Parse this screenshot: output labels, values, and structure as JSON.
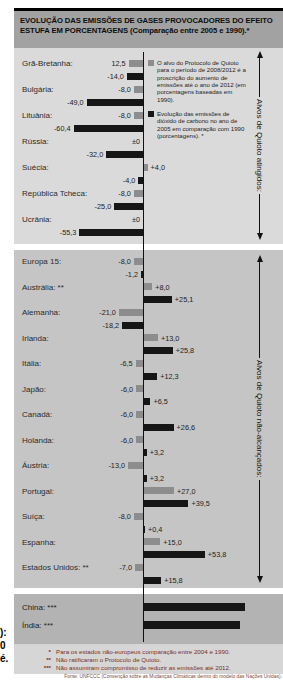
{
  "title": "EVOLUÇÃO DAS EMISSÕES DE GASES PROVOCADORES DO EFEITO ESTUFA EM PORCENTAGENS (Comparação entre 2005 e 1990).*",
  "legend": {
    "kyoto_target": {
      "swatch_color": "#8d8d8d",
      "text": "O alvo do Protocolo de Quioto para o período de 2008/2012 é a proscrição do aumento de emissões até o ano de 2012 (em porcentagens baseadas em 1990)."
    },
    "actual_2005": {
      "swatch_color": "#161616",
      "text": "Evolução das emissões de dióxido de carbono no ano de 2005 em comparação com 1990 (porcentagens). *"
    }
  },
  "side_labels": {
    "achieved": "Alvos de Quioto atingidos:",
    "not_achieved": "Alvos de Quioto não-alcançados:"
  },
  "footnotes": [
    {
      "marker": "*",
      "text": "Para os estados não-europeus comparação entre 2004 e 1990."
    },
    {
      "marker": "**",
      "text": "Não ratificaram o Protocolo de Quioto."
    },
    {
      "marker": "***",
      "text": "Não assumiram compromisso de reduzir as emissões até 2012."
    }
  ],
  "source": "Fonte: UNFCCC (Convenção sobre as Mudanças Climáticas dentro do modelo das Nações Unidas).",
  "edge_fragments": [
    "):",
    "0",
    "é."
  ],
  "colors": {
    "target_bar": "#8d8d8d",
    "actual_bar": "#161616",
    "title_band_bg": "#a2a2a2",
    "section1_bg": "#dadada",
    "section2_bg": "#c5c5c5",
    "section3_bg": "#b3b3b3",
    "footnote_bg": "#d6d6d6",
    "footnote_text": "#7b2f1d"
  },
  "chart_data": {
    "type": "bar",
    "orientation": "horizontal-diverging",
    "unit": "%",
    "baseline": 0,
    "series": [
      {
        "name": "Alvo do Protocolo de Quioto 2008/2012 (base 1990)",
        "color": "#8d8d8d"
      },
      {
        "name": "Emissões de CO2 em 2005 em comparação com 1990",
        "color": "#161616"
      }
    ],
    "groups": [
      {
        "name": "Alvos de Quioto atingidos:",
        "rows": [
          {
            "label": "Grã-Bretanha:",
            "target_label": "12,5",
            "target": -12.5,
            "actual_label": "-14,0",
            "actual": -14.0
          },
          {
            "label": "Bulgária:",
            "target_label": "-8,0",
            "target": -8.0,
            "actual_label": "-49,0",
            "actual": -49.0
          },
          {
            "label": "Lituânia:",
            "target_label": "-8,0",
            "target": -8.0,
            "actual_label": "-60,4",
            "actual": -60.4
          },
          {
            "label": "Rússia:",
            "target_label": "±0",
            "target": 0,
            "actual_label": "-32,0",
            "actual": -32.0
          },
          {
            "label": "Suécia:",
            "target_label": "+4,0",
            "target": 4.0,
            "actual_label": "-4,0",
            "actual": -4.0
          },
          {
            "label": "República Tcheca:",
            "target_label": "-8,0",
            "target": -8.0,
            "actual_label": "-25,0",
            "actual": -25.0
          },
          {
            "label": "Ucrânia:",
            "target_label": "±0",
            "target": 0,
            "actual_label": "-55,3",
            "actual": -55.3
          }
        ]
      },
      {
        "name": "Alvos de Quioto não-alcançados:",
        "rows": [
          {
            "label": "Europa 15:",
            "target_label": "-8,0",
            "target": -8.0,
            "actual_label": "-1,2",
            "actual": -1.2
          },
          {
            "label": "Austrália: **",
            "target_label": "+8,0",
            "target": 8.0,
            "actual_label": "+25,1",
            "actual": 25.1
          },
          {
            "label": "Alemanha:",
            "target_label": "-21,0",
            "target": -21.0,
            "actual_label": "-18,2",
            "actual": -18.2
          },
          {
            "label": "Irlanda:",
            "target_label": "+13,0",
            "target": 13.0,
            "actual_label": "+25,8",
            "actual": 25.8
          },
          {
            "label": "Itália:",
            "target_label": "-6,5",
            "target": -6.5,
            "actual_label": "+12,3",
            "actual": 12.3
          },
          {
            "label": "Japão:",
            "target_label": "-6,0",
            "target": -6.0,
            "actual_label": "+6,5",
            "actual": 6.5
          },
          {
            "label": "Canadá:",
            "target_label": "-6,0",
            "target": -6.0,
            "actual_label": "+26,6",
            "actual": 26.6
          },
          {
            "label": "Holanda:",
            "target_label": "-6,0",
            "target": -6.0,
            "actual_label": "+3,2",
            "actual": 3.2
          },
          {
            "label": "Áustria:",
            "target_label": "-13,0",
            "target": -13.0,
            "actual_label": "+3,2",
            "actual": 3.2
          },
          {
            "label": "Portugal:",
            "target_label": "+27,0",
            "target": 27.0,
            "actual_label": "+39,5",
            "actual": 39.5
          },
          {
            "label": "Suíça:",
            "target_label": "-8,0",
            "target": -8.0,
            "actual_label": "+0,4",
            "actual": 0.4
          },
          {
            "label": "Espanha:",
            "target_label": "+15,0",
            "target": 15.0,
            "actual_label": "+53,8",
            "actual": 53.8
          },
          {
            "label": "Estados Unidos: **",
            "target_label": "-7,0",
            "target": -7.0,
            "actual_label": "+15,8",
            "actual": 15.8
          }
        ]
      },
      {
        "name": "",
        "rows": [
          {
            "label": "China: ***",
            "actual": null,
            "actual_label": "",
            "bar_px": 102
          },
          {
            "label": "Índia: ***",
            "actual": null,
            "actual_label": "",
            "bar_px": 97
          }
        ]
      }
    ]
  }
}
